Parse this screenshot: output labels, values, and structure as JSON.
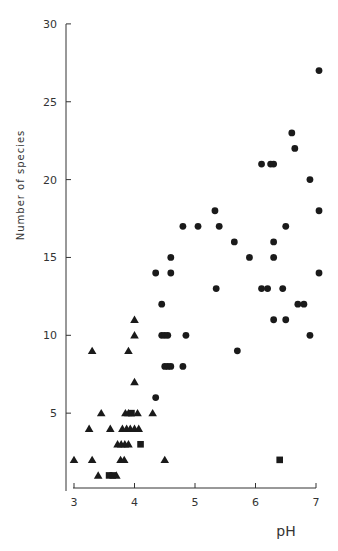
{
  "chart_data": {
    "type": "scatter",
    "title": "",
    "xlabel": "pH",
    "ylabel": "Number of species",
    "xlim": [
      3,
      7
    ],
    "ylim": [
      0,
      30
    ],
    "xticks": [
      3,
      4,
      5,
      6,
      7
    ],
    "yticks": [
      5,
      10,
      15,
      20,
      25,
      30
    ],
    "grid": false,
    "legend": null,
    "series": [
      {
        "name": "circles",
        "marker": "circle",
        "points": [
          [
            7.05,
            27
          ],
          [
            6.6,
            23
          ],
          [
            6.65,
            22
          ],
          [
            6.1,
            21
          ],
          [
            6.25,
            21
          ],
          [
            6.3,
            21
          ],
          [
            6.9,
            20
          ],
          [
            5.33,
            18
          ],
          [
            7.05,
            18
          ],
          [
            4.8,
            17
          ],
          [
            5.05,
            17
          ],
          [
            5.4,
            17
          ],
          [
            6.5,
            17
          ],
          [
            5.65,
            16
          ],
          [
            6.3,
            16
          ],
          [
            4.6,
            15
          ],
          [
            5.9,
            15
          ],
          [
            6.3,
            15
          ],
          [
            4.35,
            14
          ],
          [
            4.6,
            14
          ],
          [
            7.05,
            14
          ],
          [
            5.35,
            13
          ],
          [
            6.1,
            13
          ],
          [
            6.2,
            13
          ],
          [
            6.45,
            13
          ],
          [
            4.45,
            12
          ],
          [
            6.7,
            12
          ],
          [
            6.8,
            12
          ],
          [
            6.3,
            11
          ],
          [
            6.5,
            11
          ],
          [
            4.45,
            10
          ],
          [
            4.5,
            10
          ],
          [
            4.55,
            10
          ],
          [
            4.85,
            10
          ],
          [
            6.9,
            10
          ],
          [
            5.7,
            9
          ],
          [
            4.5,
            8
          ],
          [
            4.55,
            8
          ],
          [
            4.6,
            8
          ],
          [
            4.8,
            8
          ],
          [
            4.35,
            6
          ]
        ]
      },
      {
        "name": "triangles",
        "marker": "triangle",
        "points": [
          [
            4.0,
            11
          ],
          [
            4.0,
            10
          ],
          [
            3.3,
            9
          ],
          [
            3.9,
            9
          ],
          [
            4.0,
            7
          ],
          [
            3.45,
            5
          ],
          [
            3.85,
            5
          ],
          [
            3.9,
            5
          ],
          [
            4.05,
            5
          ],
          [
            4.3,
            5
          ],
          [
            3.25,
            4
          ],
          [
            3.6,
            4
          ],
          [
            3.8,
            4
          ],
          [
            3.87,
            4
          ],
          [
            3.93,
            4
          ],
          [
            4.0,
            4
          ],
          [
            4.07,
            4
          ],
          [
            3.72,
            3
          ],
          [
            3.78,
            3
          ],
          [
            3.84,
            3
          ],
          [
            3.9,
            3
          ],
          [
            3.0,
            2
          ],
          [
            3.3,
            2
          ],
          [
            3.77,
            2
          ],
          [
            3.83,
            2
          ],
          [
            4.5,
            2
          ],
          [
            3.4,
            1
          ],
          [
            3.7,
            1
          ]
        ]
      },
      {
        "name": "squares",
        "marker": "square",
        "points": [
          [
            3.95,
            5
          ],
          [
            4.1,
            3
          ],
          [
            3.58,
            1
          ],
          [
            3.64,
            1
          ],
          [
            6.4,
            2
          ]
        ]
      }
    ],
    "colors": {
      "marker": "#1a1a1a",
      "axis": "#333333"
    }
  }
}
